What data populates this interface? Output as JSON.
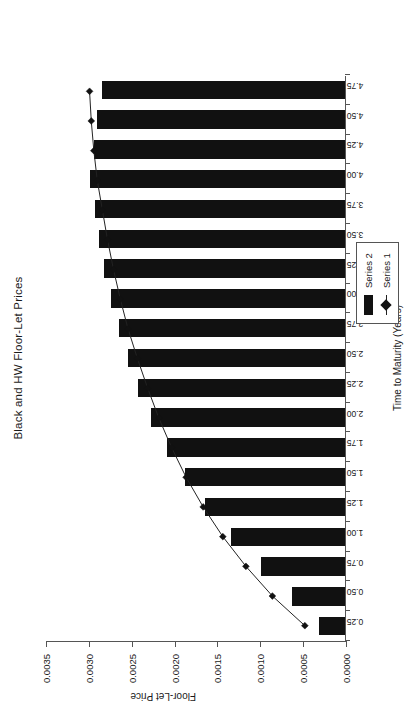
{
  "chart_data": {
    "type": "bar",
    "title": "Black and HW Floor-Let Prices",
    "xlabel": "Time to Maturity (Years)",
    "ylabel": "Floor-Let Price",
    "grid": false,
    "legend_position": "right",
    "ylim": [
      0.0,
      0.0035
    ],
    "yticks": [
      "0.0000",
      "0.0005",
      "0.0010",
      "0.0015",
      "0.0020",
      "0.0025",
      "0.0030",
      "0.0035"
    ],
    "ytick_values": [
      0.0,
      0.0005,
      0.001,
      0.0015,
      0.002,
      0.0025,
      0.003,
      0.0035
    ],
    "categories": [
      "0.25",
      "0.50",
      "0.75",
      "1.00",
      "1.25",
      "1.50",
      "1.75",
      "2.00",
      "2.25",
      "2.50",
      "2.75",
      "3.00",
      "3.25",
      "3.50",
      "3.75",
      "4.00",
      "4.25",
      "4.50",
      "4.75"
    ],
    "series": [
      {
        "name": "Series 2",
        "kind": "bar",
        "values": [
          0.0003,
          0.00062,
          0.00098,
          0.00133,
          0.00163,
          0.00187,
          0.00208,
          0.00226,
          0.00241,
          0.00253,
          0.00264,
          0.00273,
          0.00281,
          0.00287,
          0.00292,
          0.00297,
          0.00293,
          0.00289,
          0.00284
        ]
      },
      {
        "name": "Series 1",
        "kind": "line",
        "marker": "diamond",
        "values": [
          0.00047,
          0.00085,
          0.00116,
          0.00143,
          0.00166,
          0.00186,
          0.00203,
          0.00218,
          0.00231,
          0.00243,
          0.00254,
          0.00263,
          0.00271,
          0.00278,
          0.00284,
          0.0029,
          0.00294,
          0.00297,
          0.00299
        ]
      }
    ]
  },
  "legend": {
    "items": [
      {
        "label": "Series 2"
      },
      {
        "label": "Series 1"
      }
    ]
  },
  "colors": {
    "bar": "#111111",
    "line": "#222222",
    "axis": "#555555",
    "text": "#1a1a1a",
    "background": "#ffffff"
  }
}
